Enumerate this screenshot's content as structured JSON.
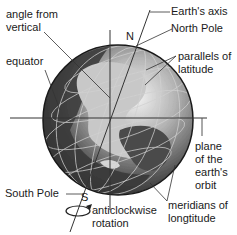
{
  "diagram": {
    "labels": {
      "angle_from_vertical": "angle from\nvertical",
      "equator": "equator",
      "earths_axis": "Earth's axis",
      "north_pole": "North Pole",
      "n_marker": "N",
      "parallels": "parallels of\nlatitude",
      "plane_of_orbit": "plane\nof the\nearth's\norbit",
      "south_pole": "South Pole",
      "s_marker": "S",
      "rotation": "anticlockwise\nrotation",
      "meridians": "meridians of\nlongtitude"
    },
    "colors": {
      "globe_dark": "#2b2b2b",
      "globe_mid": "#6e6e6e",
      "land": "#bdbdbd",
      "line": "#333333",
      "text": "#1a1a1a"
    }
  }
}
